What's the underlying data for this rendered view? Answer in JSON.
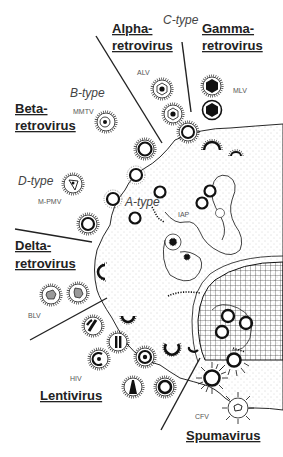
{
  "figure": {
    "genera": [
      {
        "id": "alpha",
        "line1": "Alpha-",
        "line2": "retrovirus"
      },
      {
        "id": "gamma",
        "line1": "Gamma-",
        "line2": "retrovirus"
      },
      {
        "id": "beta",
        "line1": "Beta-",
        "line2": "retrovirus"
      },
      {
        "id": "delta",
        "line1": "Delta-",
        "line2": "retrovirus"
      },
      {
        "id": "lenti",
        "line1": "Lentivirus"
      },
      {
        "id": "spuma",
        "line1": "Spumavirus"
      }
    ],
    "particle_types": {
      "c_type": "C-type",
      "b_type": "B-type",
      "d_type": "D-type",
      "a_type": "A-type"
    },
    "virus_abbreviations": {
      "alv": "ALV",
      "mlv": "MLV",
      "mmtv": "MMTV",
      "mpmv": "M-PMV",
      "iap": "IAP",
      "blv": "BLV",
      "hiv": "HIV",
      "cfv": "CFV"
    },
    "colors": {
      "ink": "#111111",
      "label": "#222222",
      "italic_label": "#444444",
      "abbr": "#555555",
      "background": "#ffffff"
    }
  }
}
